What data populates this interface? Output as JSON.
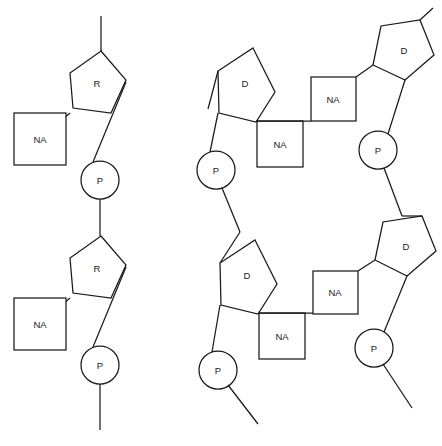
{
  "figure": {
    "background_color": "#ffffff",
    "stroke_color": "#1a1a1a",
    "fill_color": "#ffffff",
    "width": 442,
    "height": 446
  },
  "labels": {
    "ribose": "R",
    "deoxyribose": "D",
    "nucleic_acid_base": "NA",
    "phosphate": "P"
  },
  "structures": [
    {
      "id": "single-strand",
      "name": "single-stranded chain",
      "units": [
        {
          "id": "unit-1",
          "sugar": {
            "label": "R",
            "shape": "pentagon",
            "cx": 91,
            "cy": 83
          },
          "base": {
            "label": "NA",
            "shape": "square",
            "x": 14,
            "y": 113,
            "size": 52
          },
          "phosphate": {
            "label": "P",
            "shape": "circle",
            "cx": 100,
            "cy": 180,
            "r": 19
          }
        },
        {
          "id": "unit-2",
          "sugar": {
            "label": "R",
            "shape": "pentagon",
            "cx": 91,
            "cy": 268
          },
          "base": {
            "label": "NA",
            "shape": "square",
            "x": 14,
            "y": 298,
            "size": 52
          },
          "phosphate": {
            "label": "P",
            "shape": "circle",
            "cx": 100,
            "cy": 365,
            "r": 19
          }
        }
      ]
    },
    {
      "id": "double-strand",
      "name": "double-stranded chain",
      "base_pairs": [
        {
          "id": "pair-1",
          "left_sugar": {
            "label": "D",
            "shape": "pentagon",
            "cx": 240,
            "cy": 80
          },
          "left_base": {
            "label": "NA",
            "shape": "square",
            "x": 257,
            "y": 121,
            "size": 46
          },
          "left_phosphate": {
            "label": "P",
            "shape": "circle",
            "cx": 216,
            "cy": 170,
            "r": 19
          },
          "right_base": {
            "label": "NA",
            "shape": "square",
            "x": 311,
            "y": 77,
            "size": 45
          },
          "right_sugar": {
            "label": "D",
            "shape": "pentagon",
            "cx": 396,
            "cy": 57
          },
          "right_phosphate": {
            "label": "P",
            "shape": "circle",
            "cx": 378,
            "cy": 150,
            "r": 19
          }
        },
        {
          "id": "pair-2",
          "left_sugar": {
            "label": "D",
            "shape": "pentagon",
            "cx": 242,
            "cy": 272
          },
          "left_base": {
            "label": "NA",
            "shape": "square",
            "x": 259,
            "y": 313,
            "size": 46
          },
          "left_phosphate": {
            "label": "P",
            "shape": "circle",
            "cx": 218,
            "cy": 370,
            "r": 19
          },
          "right_base": {
            "label": "NA",
            "shape": "square",
            "x": 313,
            "y": 271,
            "size": 45
          },
          "right_sugar": {
            "label": "D",
            "shape": "pentagon",
            "cx": 398,
            "cy": 253
          },
          "right_phosphate": {
            "label": "P",
            "shape": "circle",
            "cx": 374,
            "cy": 348,
            "r": 19
          }
        }
      ]
    }
  ]
}
